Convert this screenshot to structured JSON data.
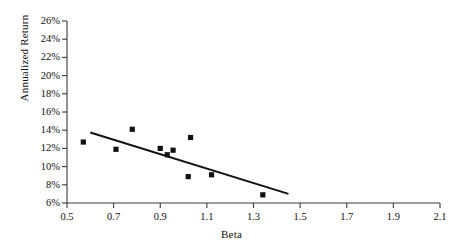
{
  "chart_data": {
    "type": "scatter",
    "title": "",
    "xlabel": "Beta",
    "ylabel": "Annualized Return",
    "xlim": [
      0.5,
      2.1
    ],
    "ylim": [
      6,
      26
    ],
    "grid": false,
    "legend": "none",
    "x_ticks": [
      "0.5",
      "0.7",
      "0.9",
      "1.1",
      "1.3",
      "1.5",
      "1.7",
      "1.9",
      "2.1"
    ],
    "x_tick_values": [
      0.5,
      0.7,
      0.9,
      1.1,
      1.3,
      1.5,
      1.7,
      1.9,
      2.1
    ],
    "y_ticks": [
      "6%",
      "8%",
      "10%",
      "12%",
      "14%",
      "16%",
      "18%",
      "20%",
      "22%",
      "24%",
      "26%"
    ],
    "y_tick_values": [
      6,
      8,
      10,
      12,
      14,
      16,
      18,
      20,
      22,
      24,
      26
    ],
    "marker": "square",
    "marker_color": "#111111",
    "points": [
      {
        "x": 0.57,
        "y": 12.7
      },
      {
        "x": 0.71,
        "y": 11.9
      },
      {
        "x": 0.78,
        "y": 14.1
      },
      {
        "x": 0.9,
        "y": 12.0
      },
      {
        "x": 0.93,
        "y": 11.3
      },
      {
        "x": 0.955,
        "y": 11.8
      },
      {
        "x": 1.03,
        "y": 13.2
      },
      {
        "x": 1.02,
        "y": 8.9
      },
      {
        "x": 1.12,
        "y": 9.1
      },
      {
        "x": 1.34,
        "y": 6.9
      }
    ],
    "trendline": {
      "x_start": 0.6,
      "y_start": 13.75,
      "x_end": 1.45,
      "y_end": 7.0,
      "color": "#111111"
    }
  },
  "axes": {
    "x_axis_name": "beta-axis",
    "y_axis_name": "return-axis"
  }
}
